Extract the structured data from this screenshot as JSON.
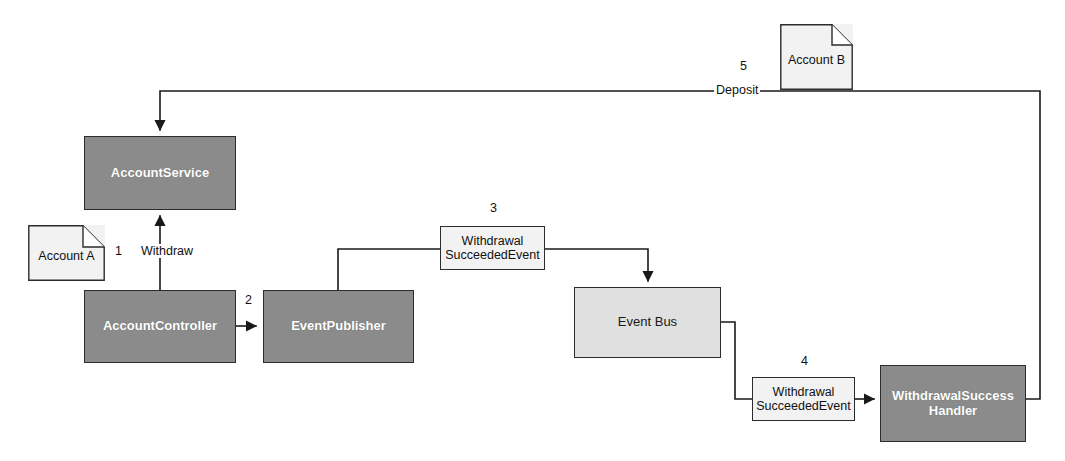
{
  "diagram": {
    "colors": {
      "component_fill": "#8b8b8b",
      "component_border": "#2c2c2c",
      "component_text": "#ffffff",
      "bus_fill": "#e0e0e0",
      "message_fill": "#f2f2f2",
      "note_fill": "#f2f2f2",
      "line": "#1a1a1a",
      "background": "#ffffff"
    },
    "nodes": {
      "account_service": {
        "label": "AccountService",
        "kind": "component"
      },
      "account_controller": {
        "label": "AccountController",
        "kind": "component"
      },
      "event_publisher": {
        "label": "EventPublisher",
        "kind": "component"
      },
      "event_bus": {
        "label": "Event Bus",
        "kind": "bus"
      },
      "withdrawal_success_handler": {
        "label_line1": "WithdrawalSuccess",
        "label_line2": "Handler",
        "kind": "component"
      },
      "event_message_3": {
        "label_line1": "Withdrawal",
        "label_line2": "SucceededEvent",
        "kind": "message"
      },
      "event_message_4": {
        "label_line1": "Withdrawal",
        "label_line2": "SucceededEvent",
        "kind": "message"
      }
    },
    "notes": {
      "account_a": {
        "label": "Account A"
      },
      "account_b": {
        "label": "Account B"
      }
    },
    "edge_labels": {
      "step1_number": "1",
      "step1_name": "Withdraw",
      "step2_number": "2",
      "step3_number": "3",
      "step4_number": "4",
      "step5_number": "5",
      "step5_name": "Deposit"
    }
  }
}
